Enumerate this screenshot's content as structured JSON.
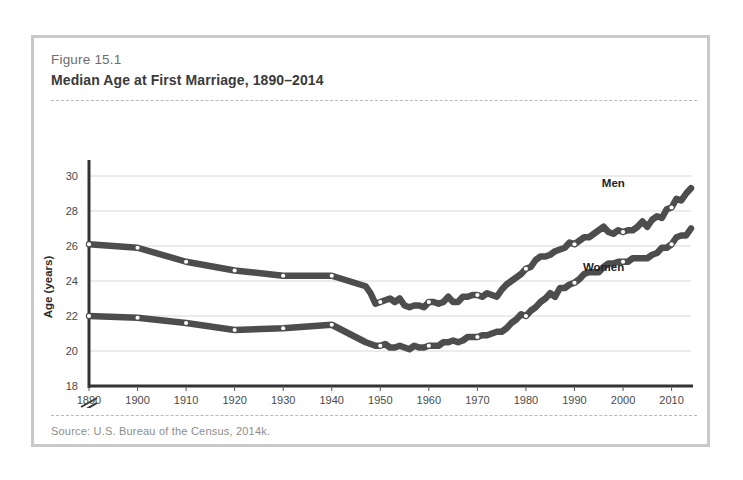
{
  "figure": {
    "number": "Figure 15.1",
    "title": "Median Age at First Marriage, 1890–2014",
    "source": "Source: U.S. Bureau of the Census, 2014k."
  },
  "chart_data": {
    "type": "line",
    "title": "Median Age at First Marriage, 1890–2014",
    "xlabel": "",
    "ylabel": "Age (years)",
    "xlim": [
      1890,
      2014
    ],
    "ylim": [
      18,
      30
    ],
    "y_ticks": [
      18,
      20,
      22,
      24,
      26,
      28,
      30
    ],
    "x_ticks": [
      1890,
      1900,
      1910,
      1920,
      1930,
      1940,
      1950,
      1960,
      1970,
      1980,
      1990,
      2000,
      2010
    ],
    "axis_break": true,
    "grid": true,
    "legend_position": "inline-labels",
    "line_color": "#4d4d4d",
    "marker_color": "#ffffff",
    "series": [
      {
        "name": "Men",
        "label": "Men",
        "label_x": 1998,
        "label_y": 29.4,
        "decade_markers": [
          1890,
          1900,
          1910,
          1920,
          1930,
          1940,
          1950,
          1960,
          1970,
          1980,
          1990,
          2000,
          2010
        ],
        "x": [
          1890,
          1900,
          1910,
          1920,
          1930,
          1940,
          1947,
          1948,
          1949,
          1950,
          1951,
          1952,
          1953,
          1954,
          1955,
          1956,
          1957,
          1958,
          1959,
          1960,
          1961,
          1962,
          1963,
          1964,
          1965,
          1966,
          1967,
          1968,
          1969,
          1970,
          1971,
          1972,
          1973,
          1974,
          1975,
          1976,
          1977,
          1978,
          1979,
          1980,
          1981,
          1982,
          1983,
          1984,
          1985,
          1986,
          1987,
          1988,
          1989,
          1990,
          1991,
          1992,
          1993,
          1994,
          1995,
          1996,
          1997,
          1998,
          1999,
          2000,
          2001,
          2002,
          2003,
          2004,
          2005,
          2006,
          2007,
          2008,
          2009,
          2010,
          2011,
          2012,
          2013,
          2014
        ],
        "y": [
          26.1,
          25.9,
          25.1,
          24.6,
          24.3,
          24.3,
          23.7,
          23.3,
          22.7,
          22.8,
          22.9,
          23.0,
          22.8,
          23.0,
          22.6,
          22.5,
          22.6,
          22.6,
          22.5,
          22.8,
          22.8,
          22.7,
          22.8,
          23.1,
          22.8,
          22.8,
          23.1,
          23.1,
          23.2,
          23.2,
          23.1,
          23.3,
          23.2,
          23.1,
          23.5,
          23.8,
          24.0,
          24.2,
          24.4,
          24.7,
          24.8,
          25.2,
          25.4,
          25.4,
          25.5,
          25.7,
          25.8,
          25.9,
          26.2,
          26.1,
          26.3,
          26.5,
          26.5,
          26.7,
          26.9,
          27.1,
          26.8,
          26.7,
          26.9,
          26.8,
          26.9,
          26.9,
          27.1,
          27.4,
          27.1,
          27.5,
          27.7,
          27.6,
          28.1,
          28.2,
          28.7,
          28.6,
          29.0,
          29.3
        ]
      },
      {
        "name": "Women",
        "label": "Women",
        "label_x": 1996,
        "label_y": 24.6,
        "decade_markers": [
          1890,
          1900,
          1910,
          1920,
          1930,
          1940,
          1950,
          1960,
          1970,
          1980,
          1990,
          2000,
          2010
        ],
        "x": [
          1890,
          1900,
          1910,
          1920,
          1930,
          1940,
          1947,
          1948,
          1949,
          1950,
          1951,
          1952,
          1953,
          1954,
          1955,
          1956,
          1957,
          1958,
          1959,
          1960,
          1961,
          1962,
          1963,
          1964,
          1965,
          1966,
          1967,
          1968,
          1969,
          1970,
          1971,
          1972,
          1973,
          1974,
          1975,
          1976,
          1977,
          1978,
          1979,
          1980,
          1981,
          1982,
          1983,
          1984,
          1985,
          1986,
          1987,
          1988,
          1989,
          1990,
          1991,
          1992,
          1993,
          1994,
          1995,
          1996,
          1997,
          1998,
          1999,
          2000,
          2001,
          2002,
          2003,
          2004,
          2005,
          2006,
          2007,
          2008,
          2009,
          2010,
          2011,
          2012,
          2013,
          2014
        ],
        "y": [
          22.0,
          21.9,
          21.6,
          21.2,
          21.3,
          21.5,
          20.5,
          20.4,
          20.3,
          20.3,
          20.4,
          20.2,
          20.2,
          20.3,
          20.2,
          20.1,
          20.3,
          20.2,
          20.2,
          20.3,
          20.3,
          20.3,
          20.5,
          20.5,
          20.6,
          20.5,
          20.6,
          20.8,
          20.8,
          20.8,
          20.9,
          20.9,
          21.0,
          21.1,
          21.1,
          21.3,
          21.6,
          21.8,
          22.1,
          22.0,
          22.3,
          22.5,
          22.8,
          23.0,
          23.3,
          23.1,
          23.6,
          23.6,
          23.8,
          23.9,
          24.1,
          24.4,
          24.5,
          24.5,
          24.5,
          24.8,
          25.0,
          25.0,
          25.1,
          25.1,
          25.1,
          25.3,
          25.3,
          25.3,
          25.3,
          25.5,
          25.6,
          25.9,
          25.9,
          26.1,
          26.5,
          26.6,
          26.6,
          27.0
        ]
      }
    ]
  }
}
